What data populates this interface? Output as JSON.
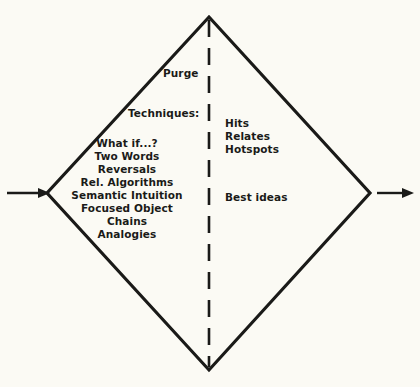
{
  "figure": {
    "type": "diamond-flow-diagram",
    "background_color": "#fbfaf4",
    "line_color": "#1a1a18",
    "shape": "diamond",
    "divider": "vertical-dashed-line"
  },
  "flow": {
    "input_arrow_label": "",
    "output_arrow_label": ""
  },
  "left_side": {
    "stage_label": "Purge",
    "section_label": "Techniques:",
    "techniques": [
      "What if...?",
      "Two Words",
      "Reversals",
      "Rel. Algorithms",
      "Semantic Intuition",
      "Focused Object",
      "Chains",
      "Analogies"
    ]
  },
  "right_side": {
    "outputs": [
      "Hits",
      "Relates",
      "Hotspots"
    ],
    "result_label": "Best ideas"
  }
}
